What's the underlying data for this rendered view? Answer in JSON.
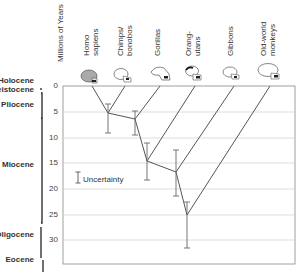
{
  "axis": {
    "title": "Millions of Years",
    "ticks": [
      "0",
      "5",
      "10",
      "15",
      "20",
      "25",
      "30"
    ]
  },
  "taxa": [
    {
      "label": "Homo sapiens",
      "lines": [
        "Homo",
        "sapiens"
      ],
      "icon": "human-skull-icon"
    },
    {
      "label": "Chimps/bonobos",
      "lines": [
        "Chimps/",
        "bonobos"
      ],
      "icon": "chimp-skull-icon"
    },
    {
      "label": "Gorillas",
      "lines": [
        "Gorillas"
      ],
      "icon": "gorilla-skull-icon"
    },
    {
      "label": "Orangutans",
      "lines": [
        "Orang-",
        "utans"
      ],
      "icon": "orangutan-skull-icon"
    },
    {
      "label": "Gibbons",
      "lines": [
        "Gibbons"
      ],
      "icon": "gibbon-skull-icon"
    },
    {
      "label": "Old-world monkeys",
      "lines": [
        "Old-world",
        "monkeys"
      ],
      "icon": "monkey-skull-icon"
    }
  ],
  "epochs": [
    {
      "label": "Holocene"
    },
    {
      "label": "Pleistocene",
      "visible_text": "leistocene"
    },
    {
      "label": "Pliocene"
    },
    {
      "label": "Miocene"
    },
    {
      "label": "Oligocene"
    },
    {
      "label": "Eocene"
    }
  ],
  "legend": {
    "uncertainty_label": "Uncertainty"
  },
  "divergences_myr": [
    {
      "between": "Homo sapiens / Chimps",
      "estimate": 5.5,
      "range": [
        3.5,
        9
      ]
    },
    {
      "between": "Gorillas",
      "estimate": 6.5,
      "range": [
        5,
        9.5
      ]
    },
    {
      "between": "Orangutans",
      "estimate": 14.5,
      "range": [
        11,
        18.5
      ]
    },
    {
      "between": "Gibbons",
      "estimate": 16.5,
      "range": [
        12.5,
        21
      ]
    },
    {
      "between": "Old-world monkeys",
      "estimate": 25,
      "range": [
        22.5,
        31.5
      ]
    }
  ],
  "colors": {
    "lines": "#555555",
    "grid": "#cccccc",
    "frame": "#888888",
    "bracket": "#222222"
  }
}
